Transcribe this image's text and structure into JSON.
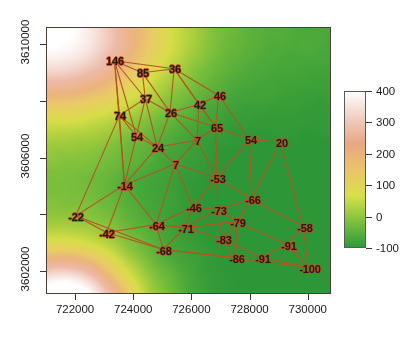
{
  "chart_data": {
    "type": "heatmap",
    "title": "",
    "xlabel": "",
    "ylabel": "",
    "xlim": [
      721000,
      730800
    ],
    "ylim": [
      3601200,
      3610600
    ],
    "grid": false,
    "legend_position": "right",
    "colorbar": {
      "label": "",
      "ticks": [
        "400",
        "300",
        "200",
        "100",
        "0",
        "-100"
      ],
      "tick_values": [
        400,
        300,
        200,
        100,
        0,
        -100
      ],
      "vmin": -100,
      "vmax": 400,
      "colors": [
        "#2e9b3c",
        "#7fc23c",
        "#d9e04a",
        "#ecc46a",
        "#e8a882",
        "#f0cfc2",
        "#ffffff"
      ]
    },
    "x_axis": {
      "ticks": [
        "722000",
        "724000",
        "726000",
        "728000",
        "730000"
      ],
      "tick_values": [
        722000,
        724000,
        726000,
        728000,
        730000
      ]
    },
    "y_axis": {
      "ticks": [
        "3610000",
        "3606000",
        "3602000"
      ],
      "tick_values": [
        3610000,
        3606000,
        3602000
      ]
    },
    "overlay": {
      "type": "triangulated-network",
      "edge_color": "#b4551f",
      "nodes": [
        {
          "label": "146",
          "px": 114,
          "py": 60
        },
        {
          "label": "85",
          "px": 142,
          "py": 72
        },
        {
          "label": "36",
          "px": 174,
          "py": 68
        },
        {
          "label": "37",
          "px": 145,
          "py": 98
        },
        {
          "label": "74",
          "px": 119,
          "py": 115
        },
        {
          "label": "26",
          "px": 170,
          "py": 112
        },
        {
          "label": "42",
          "px": 199,
          "py": 104
        },
        {
          "label": "46",
          "px": 219,
          "py": 95
        },
        {
          "label": "54",
          "px": 136,
          "py": 136
        },
        {
          "label": "65",
          "px": 216,
          "py": 127
        },
        {
          "label": "54",
          "px": 250,
          "py": 139
        },
        {
          "label": "20",
          "px": 281,
          "py": 142
        },
        {
          "label": "24",
          "px": 157,
          "py": 147
        },
        {
          "label": "7",
          "px": 197,
          "py": 140
        },
        {
          "label": "7",
          "px": 175,
          "py": 164
        },
        {
          "label": "-53",
          "px": 217,
          "py": 178
        },
        {
          "label": "-14",
          "px": 124,
          "py": 185
        },
        {
          "label": "-66",
          "px": 252,
          "py": 199
        },
        {
          "label": "-46",
          "px": 193,
          "py": 207
        },
        {
          "label": "-73",
          "px": 218,
          "py": 210
        },
        {
          "label": "-22",
          "px": 75,
          "py": 216
        },
        {
          "label": "-64",
          "px": 156,
          "py": 225
        },
        {
          "label": "-71",
          "px": 185,
          "py": 228
        },
        {
          "label": "-79",
          "px": 237,
          "py": 222
        },
        {
          "label": "-58",
          "px": 304,
          "py": 227
        },
        {
          "label": "-42",
          "px": 106,
          "py": 233
        },
        {
          "label": "-83",
          "px": 223,
          "py": 239
        },
        {
          "label": "-91",
          "px": 288,
          "py": 245
        },
        {
          "label": "-68",
          "px": 163,
          "py": 250
        },
        {
          "label": "-86",
          "px": 236,
          "py": 258
        },
        {
          "label": "-91",
          "px": 262,
          "py": 258
        },
        {
          "label": "-100",
          "px": 309,
          "py": 268
        }
      ],
      "edges": [
        [
          0,
          1
        ],
        [
          0,
          2
        ],
        [
          0,
          3
        ],
        [
          0,
          4
        ],
        [
          0,
          8
        ],
        [
          0,
          16
        ],
        [
          1,
          2
        ],
        [
          1,
          3
        ],
        [
          1,
          5
        ],
        [
          2,
          5
        ],
        [
          2,
          6
        ],
        [
          2,
          7
        ],
        [
          2,
          9
        ],
        [
          3,
          4
        ],
        [
          3,
          5
        ],
        [
          3,
          8
        ],
        [
          3,
          12
        ],
        [
          4,
          8
        ],
        [
          4,
          12
        ],
        [
          4,
          16
        ],
        [
          4,
          20
        ],
        [
          5,
          6
        ],
        [
          5,
          9
        ],
        [
          5,
          12
        ],
        [
          5,
          13
        ],
        [
          6,
          7
        ],
        [
          6,
          9
        ],
        [
          6,
          13
        ],
        [
          7,
          9
        ],
        [
          7,
          10
        ],
        [
          8,
          12
        ],
        [
          8,
          16
        ],
        [
          9,
          10
        ],
        [
          9,
          13
        ],
        [
          9,
          15
        ],
        [
          10,
          11
        ],
        [
          10,
          15
        ],
        [
          10,
          17
        ],
        [
          11,
          17
        ],
        [
          11,
          24
        ],
        [
          12,
          13
        ],
        [
          12,
          14
        ],
        [
          12,
          16
        ],
        [
          13,
          14
        ],
        [
          13,
          15
        ],
        [
          14,
          15
        ],
        [
          14,
          16
        ],
        [
          14,
          18
        ],
        [
          14,
          21
        ],
        [
          15,
          17
        ],
        [
          15,
          18
        ],
        [
          15,
          19
        ],
        [
          16,
          20
        ],
        [
          16,
          21
        ],
        [
          16,
          25
        ],
        [
          17,
          19
        ],
        [
          17,
          23
        ],
        [
          17,
          24
        ],
        [
          18,
          19
        ],
        [
          18,
          21
        ],
        [
          18,
          22
        ],
        [
          19,
          22
        ],
        [
          19,
          23
        ],
        [
          19,
          26
        ],
        [
          20,
          25
        ],
        [
          20,
          28
        ],
        [
          21,
          22
        ],
        [
          21,
          25
        ],
        [
          21,
          28
        ],
        [
          22,
          23
        ],
        [
          22,
          26
        ],
        [
          22,
          28
        ],
        [
          23,
          26
        ],
        [
          23,
          27
        ],
        [
          23,
          29
        ],
        [
          24,
          27
        ],
        [
          24,
          31
        ],
        [
          25,
          28
        ],
        [
          26,
          29
        ],
        [
          26,
          30
        ],
        [
          27,
          30
        ],
        [
          27,
          31
        ],
        [
          28,
          29
        ],
        [
          28,
          31
        ],
        [
          29,
          30
        ],
        [
          30,
          31
        ]
      ]
    }
  }
}
